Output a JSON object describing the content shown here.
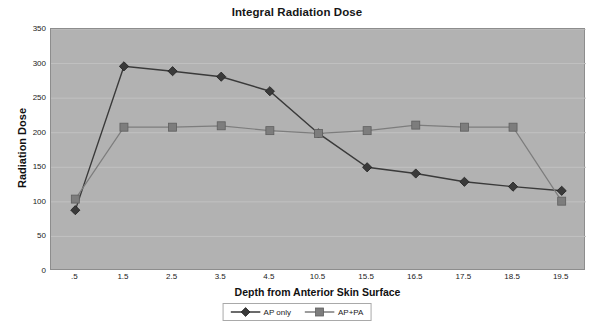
{
  "chart_data": {
    "type": "line",
    "title": "Integral Radiation Dose",
    "xlabel": "Depth from Anterior Skin Surface",
    "ylabel": "Radiation Dose",
    "categories": [
      "0.5",
      "1.5",
      "2.5",
      "3.5",
      "4.5",
      "10.5",
      "15.5",
      "16.5",
      "17.5",
      "18.5",
      "19.5"
    ],
    "tick_labels": [
      ".5",
      "1.5",
      "2.5",
      "3.5",
      "4.5",
      "10.5",
      "15.5",
      "16.5",
      "17.5",
      "18.5",
      "19.5"
    ],
    "yticks": [
      0,
      50,
      100,
      150,
      200,
      250,
      300,
      350
    ],
    "ylim": [
      0,
      350
    ],
    "grid": true,
    "legend_position": "bottom",
    "series": [
      {
        "name": "AP only",
        "marker": "diamond",
        "color": "#3a3a3a",
        "values": [
          88,
          296,
          289,
          281,
          260,
          199,
          150,
          141,
          129,
          122,
          116
        ]
      },
      {
        "name": "AP+PA",
        "marker": "square",
        "color": "#7d7d7d",
        "values": [
          104,
          208,
          208,
          210,
          203,
          199,
          203,
          211,
          208,
          208,
          101
        ]
      }
    ]
  },
  "colors": {
    "plot_background": "#b2b2b2",
    "gridline": "#c2c2c2",
    "axis": "#8d8d8d",
    "series_ap_only": "#3a3a3a",
    "series_ap_pa": "#7d7d7d",
    "text": "#1a1a1a"
  }
}
